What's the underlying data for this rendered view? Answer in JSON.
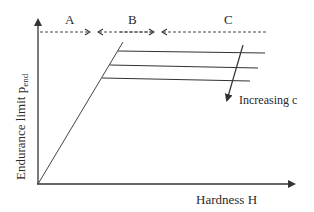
{
  "diagram": {
    "title": "",
    "regions": [
      {
        "label": "A"
      },
      {
        "label": "B"
      },
      {
        "label": "C"
      }
    ],
    "y_axis": {
      "label": "Endurance limit p",
      "subscript": "end"
    },
    "x_axis": {
      "label": "Hardness H"
    },
    "annotation": {
      "label": "Increasing c"
    },
    "colors": {
      "line": "#333333",
      "dashed": "#444444",
      "text": "#2a2a2a"
    }
  }
}
